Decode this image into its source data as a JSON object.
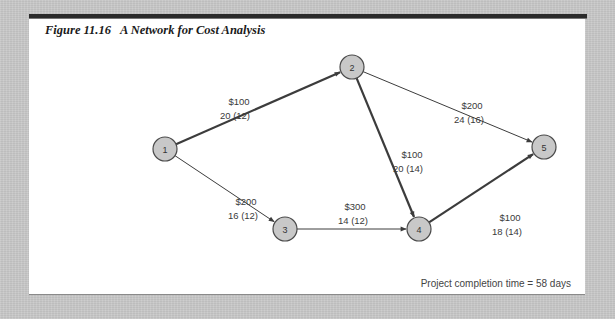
{
  "figure": {
    "number": "Figure 11.16",
    "title": "A Network for Cost Analysis"
  },
  "nodes": [
    {
      "id": "1",
      "label": "1"
    },
    {
      "id": "2",
      "label": "2"
    },
    {
      "id": "3",
      "label": "3"
    },
    {
      "id": "4",
      "label": "4"
    },
    {
      "id": "5",
      "label": "5"
    }
  ],
  "edges": [
    {
      "from": "1",
      "to": "2",
      "cost": "$100",
      "times": "20 (12)",
      "critical": true
    },
    {
      "from": "1",
      "to": "3",
      "cost": "$200",
      "times": "16 (12)",
      "critical": false
    },
    {
      "from": "2",
      "to": "4",
      "cost": "$100",
      "times": "20 (14)",
      "critical": true
    },
    {
      "from": "2",
      "to": "5",
      "cost": "$200",
      "times": "24 (16)",
      "critical": false
    },
    {
      "from": "3",
      "to": "4",
      "cost": "$300",
      "times": "14 (12)",
      "critical": false
    },
    {
      "from": "4",
      "to": "5",
      "cost": "$100",
      "times": "18 (14)",
      "critical": true
    }
  ],
  "footer": {
    "completion_text": "Project completion time = 58 days"
  },
  "colors": {
    "node_fill": "#c8c8c8",
    "node_stroke": "#4a4a4a",
    "edge": "#3c3c3c"
  }
}
